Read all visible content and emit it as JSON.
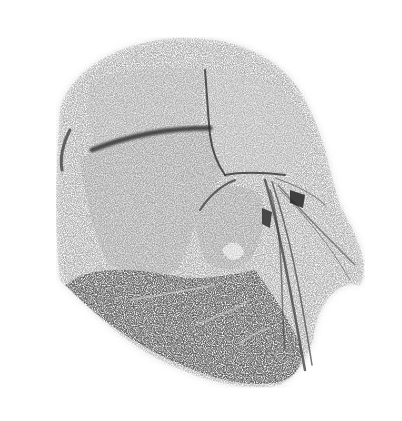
{
  "image": {
    "description": "Stippled grayscale sketch of a cranial/anatomical specimen with bone plates separated by suture lines, nerves and vessels fanning to the right, and dark tissue at the lower portion",
    "style": "monochrome stipple / dithered pencil",
    "colors": {
      "background": "#ffffff",
      "light_tone": "#e8e8e8",
      "mid_tone": "#9a9a9a",
      "dark_tone": "#3a3a3a",
      "darkest_tone": "#1e1e1e"
    }
  }
}
